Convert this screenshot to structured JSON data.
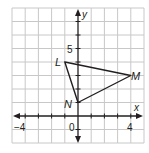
{
  "graph": {
    "x_axis_label": "x",
    "y_axis_label": "y",
    "x_range": [
      -5,
      5
    ],
    "y_range": [
      -2,
      8
    ],
    "tick_labels": {
      "x_neg": "−4",
      "origin": "0",
      "x_pos": "4",
      "y_pos": "5"
    },
    "colors": {
      "grid": "#c8c8c8",
      "axis": "#231f20",
      "triangle": "#231f20",
      "border": "#d0d0d0"
    }
  },
  "triangle": {
    "points": [
      {
        "label": "L",
        "x": -1,
        "y": 4
      },
      {
        "label": "M",
        "x": 4,
        "y": 3
      },
      {
        "label": "N",
        "x": 0,
        "y": 1
      }
    ]
  }
}
